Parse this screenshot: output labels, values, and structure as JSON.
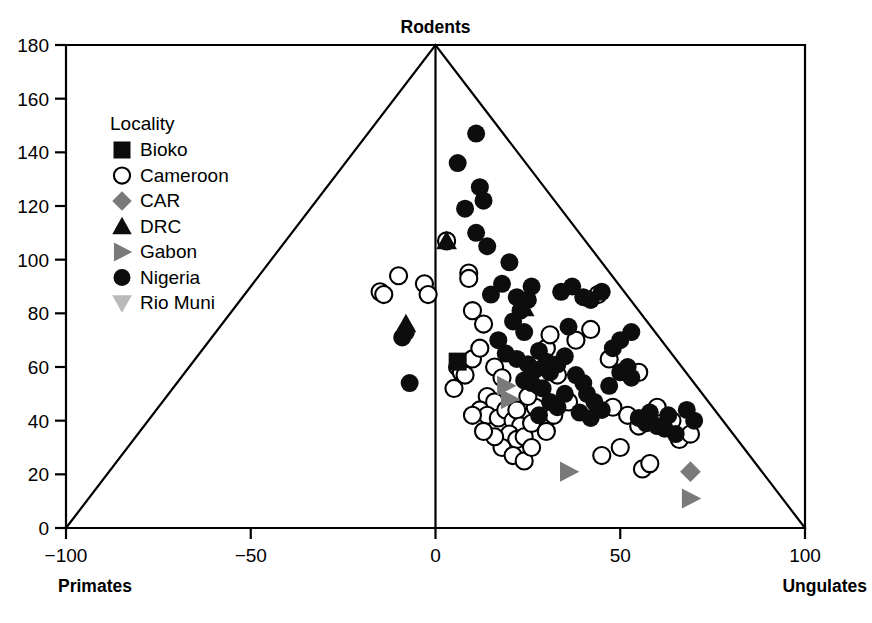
{
  "chart_data": {
    "type": "scatter",
    "title": "",
    "xlabel": "",
    "ylabel": "",
    "xlim": [
      -100,
      100
    ],
    "ylim": [
      0,
      180
    ],
    "grid": false,
    "corner_labels": {
      "top": "Rodents",
      "bottom_left": "Primates",
      "bottom_right": "Ungulates"
    },
    "xticks": [
      -100,
      -50,
      0,
      50,
      100
    ],
    "xtick_labels": [
      "−100",
      "−50",
      "0",
      "50",
      "100"
    ],
    "yticks": [
      0,
      20,
      40,
      60,
      80,
      100,
      120,
      140,
      160,
      180
    ],
    "ytick_labels": [
      "0",
      "20",
      "40",
      "60",
      "80",
      "100",
      "120",
      "140",
      "160",
      "180"
    ],
    "triangle_vertices": [
      [
        -100,
        0
      ],
      [
        0,
        180
      ],
      [
        100,
        0
      ]
    ],
    "legend": {
      "title": "Locality",
      "position": "upper-left",
      "entries": [
        {
          "name": "Bioko",
          "marker": "square",
          "fill": "#0d0d0d"
        },
        {
          "name": "Cameroon",
          "marker": "circle-open",
          "fill": "#ffffff"
        },
        {
          "name": "CAR",
          "marker": "diamond",
          "fill": "#7a7a7a"
        },
        {
          "name": "DRC",
          "marker": "triangle-up",
          "fill": "#0d0d0d"
        },
        {
          "name": "Gabon",
          "marker": "triangle-right",
          "fill": "#7a7a7a"
        },
        {
          "name": "Nigeria",
          "marker": "circle-filled",
          "fill": "#0d0d0d"
        },
        {
          "name": "Rio Muni",
          "marker": "triangle-down",
          "fill": "#b9b9b9"
        }
      ]
    },
    "series": [
      {
        "name": "Bioko",
        "marker": "square",
        "fill": "#0d0d0d",
        "points": [
          [
            6,
            62
          ]
        ]
      },
      {
        "name": "Cameroon",
        "marker": "circle-open",
        "fill": "#ffffff",
        "points": [
          [
            -15,
            88
          ],
          [
            -14,
            87
          ],
          [
            -10,
            94
          ],
          [
            -3,
            91
          ],
          [
            -2,
            87
          ],
          [
            3,
            107
          ],
          [
            9,
            95
          ],
          [
            9,
            93
          ],
          [
            10,
            81
          ],
          [
            13,
            76
          ],
          [
            6,
            60
          ],
          [
            7,
            58
          ],
          [
            8,
            57
          ],
          [
            5,
            52
          ],
          [
            10,
            63
          ],
          [
            12,
            67
          ],
          [
            16,
            60
          ],
          [
            18,
            56
          ],
          [
            14,
            49
          ],
          [
            16,
            47
          ],
          [
            12,
            44
          ],
          [
            14,
            42
          ],
          [
            10,
            42
          ],
          [
            17,
            41
          ],
          [
            19,
            44
          ],
          [
            21,
            40
          ],
          [
            22,
            44
          ],
          [
            23,
            38
          ],
          [
            20,
            35
          ],
          [
            22,
            33
          ],
          [
            24,
            34
          ],
          [
            26,
            39
          ],
          [
            27,
            45
          ],
          [
            25,
            49
          ],
          [
            28,
            53
          ],
          [
            29,
            58
          ],
          [
            32,
            42
          ],
          [
            30,
            36
          ],
          [
            18,
            30
          ],
          [
            21,
            27
          ],
          [
            24,
            25
          ],
          [
            26,
            30
          ],
          [
            16,
            34
          ],
          [
            13,
            36
          ],
          [
            30,
            67
          ],
          [
            31,
            72
          ],
          [
            33,
            57
          ],
          [
            36,
            47
          ],
          [
            38,
            70
          ],
          [
            42,
            74
          ],
          [
            44,
            87
          ],
          [
            47,
            63
          ],
          [
            48,
            45
          ],
          [
            52,
            42
          ],
          [
            55,
            38
          ],
          [
            56,
            22
          ],
          [
            58,
            24
          ],
          [
            60,
            45
          ],
          [
            64,
            40
          ],
          [
            66,
            33
          ],
          [
            69,
            35
          ],
          [
            55,
            58
          ],
          [
            50,
            30
          ],
          [
            45,
            27
          ]
        ]
      },
      {
        "name": "CAR",
        "marker": "diamond",
        "fill": "#7a7a7a",
        "points": [
          [
            69,
            21
          ]
        ]
      },
      {
        "name": "DRC",
        "marker": "triangle-up",
        "fill": "#0d0d0d",
        "points": [
          [
            -8,
            76
          ],
          [
            3,
            107
          ],
          [
            24,
            82
          ]
        ]
      },
      {
        "name": "Gabon",
        "marker": "triangle-right",
        "fill": "#7a7a7a",
        "points": [
          [
            19,
            53
          ],
          [
            20,
            48
          ],
          [
            36,
            21
          ],
          [
            69,
            11
          ]
        ]
      },
      {
        "name": "Nigeria",
        "marker": "circle-filled",
        "fill": "#0d0d0d",
        "points": [
          [
            -8,
            73
          ],
          [
            -9,
            71
          ],
          [
            -7,
            54
          ],
          [
            6,
            136
          ],
          [
            11,
            147
          ],
          [
            12,
            127
          ],
          [
            8,
            119
          ],
          [
            13,
            122
          ],
          [
            11,
            110
          ],
          [
            14,
            105
          ],
          [
            20,
            99
          ],
          [
            18,
            91
          ],
          [
            22,
            86
          ],
          [
            25,
            85
          ],
          [
            26,
            90
          ],
          [
            23,
            81
          ],
          [
            21,
            77
          ],
          [
            24,
            73
          ],
          [
            19,
            65
          ],
          [
            22,
            63
          ],
          [
            25,
            61
          ],
          [
            27,
            59
          ],
          [
            24,
            55
          ],
          [
            26,
            54
          ],
          [
            28,
            66
          ],
          [
            30,
            62
          ],
          [
            31,
            58
          ],
          [
            29,
            52
          ],
          [
            33,
            61
          ],
          [
            35,
            64
          ],
          [
            34,
            88
          ],
          [
            37,
            90
          ],
          [
            40,
            86
          ],
          [
            42,
            85
          ],
          [
            45,
            88
          ],
          [
            38,
            57
          ],
          [
            40,
            54
          ],
          [
            41,
            50
          ],
          [
            43,
            47
          ],
          [
            39,
            43
          ],
          [
            42,
            41
          ],
          [
            45,
            44
          ],
          [
            47,
            53
          ],
          [
            50,
            58
          ],
          [
            52,
            60
          ],
          [
            53,
            56
          ],
          [
            55,
            41
          ],
          [
            57,
            39
          ],
          [
            58,
            43
          ],
          [
            60,
            38
          ],
          [
            62,
            37
          ],
          [
            63,
            42
          ],
          [
            65,
            35
          ],
          [
            68,
            44
          ],
          [
            70,
            40
          ],
          [
            48,
            67
          ],
          [
            50,
            70
          ],
          [
            53,
            73
          ],
          [
            31,
            47
          ],
          [
            33,
            45
          ],
          [
            28,
            42
          ],
          [
            35,
            50
          ],
          [
            17,
            70
          ],
          [
            15,
            87
          ],
          [
            36,
            75
          ]
        ]
      },
      {
        "name": "Rio Muni",
        "marker": "triangle-down",
        "fill": "#b9b9b9",
        "points": []
      }
    ]
  }
}
